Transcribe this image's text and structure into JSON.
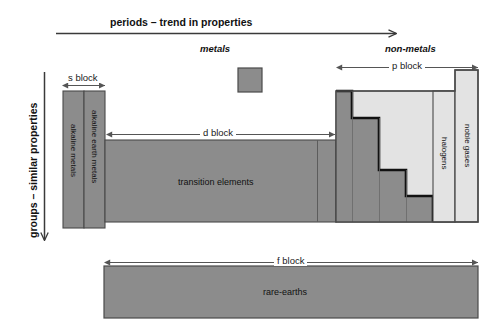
{
  "diagram": {
    "axes": {
      "horizontal": {
        "label": "periods – trend in properties",
        "direction": "left-to-right",
        "arrow": "arrow-right"
      },
      "vertical": {
        "label": "groups – similar properties",
        "direction": "top-to-bottom",
        "arrow": "arrow-down"
      }
    },
    "region_labels": {
      "metals": "metals",
      "non_metals": "non-metals"
    },
    "block_measures": [
      {
        "key": "s",
        "label": "s block"
      },
      {
        "key": "d",
        "label": "d block"
      },
      {
        "key": "p",
        "label": "p block"
      },
      {
        "key": "f",
        "label": "f block"
      }
    ],
    "cells": [
      {
        "key": "alkaline-metals",
        "label": "alkaline metals",
        "fill": "#8c8c8c"
      },
      {
        "key": "alkaline-earth-metals",
        "label": "alkaline earth metals",
        "fill": "#8c8c8c"
      },
      {
        "key": "transition-elements",
        "label": "transition elements",
        "fill": "#8c8c8c"
      },
      {
        "key": "halogens",
        "label": "halogens",
        "fill": "#e3e3e3"
      },
      {
        "key": "noble-gases",
        "label": "noble gases",
        "fill": "#e3e3e3"
      },
      {
        "key": "rare-earths",
        "label": "rare-earths",
        "fill": "#8c8c8c"
      }
    ],
    "legend_swatch": {
      "name": "metalloid-swatch",
      "fill": "#8c8c8c"
    },
    "colors": {
      "metal_gray": "#8c8c8c",
      "nonmetal_light": "#e3e3e3",
      "outline": "#4a4a4a",
      "staircase": "#111111",
      "arrow": "#4a4a4a",
      "text": "#111111",
      "background": "#ffffff"
    }
  }
}
